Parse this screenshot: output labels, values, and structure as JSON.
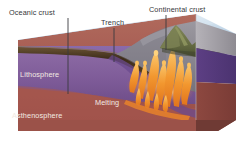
{
  "figure": {
    "background_color": "#ffffff"
  },
  "labels": {
    "oceanic_crust": "Oceanic crust",
    "trench": "Trench",
    "continental_crust": "Continental crust",
    "lithosphere": "Lithosphere",
    "asthenosphere": "Asthenosphere",
    "melting": "Melting"
  },
  "colors": {
    "ocean_surface": "#b9cfe2",
    "ocean_surface_far": "#dce7f0",
    "ocean_deep": "#8fb0cc",
    "oceanic_crust": "#4a3622",
    "oceanic_crust_dark": "#2e2116",
    "lithosphere": "#7a5b9e",
    "lithosphere_deep": "#5a3f7d",
    "asthenosphere": "#a55a52",
    "asthenosphere_deep": "#8c443f",
    "continental_crust": "#8e8b92",
    "continental_crust_shadow": "#6f6d76",
    "mountain": "#6d7349",
    "mountain_dark": "#4e5434",
    "magma": "#f0922c",
    "magma_bright": "#f8b95a",
    "leader_line": "#3a3a3e",
    "label_dark": "#36363a",
    "label_light": "#f2eae2"
  },
  "leader_lines": [
    {
      "name": "oceanic-crust-leader",
      "x1": 68,
      "y1": 18,
      "x2": 68,
      "y2": 94
    },
    {
      "name": "trench-leader",
      "x1": 114,
      "y1": 28,
      "x2": 114,
      "y2": 62
    },
    {
      "name": "continental-crust-leader",
      "x1": 166,
      "y1": 15,
      "x2": 166,
      "y2": 50
    }
  ],
  "features": {
    "magma_plume_count": 11,
    "slab_dip_label": "descending oceanic plate",
    "view": "3D block diagram"
  }
}
